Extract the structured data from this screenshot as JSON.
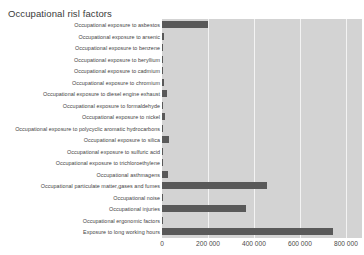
{
  "top_strip": {
    "cut_text": "———  ———— ——  ——— ———— ——— —— ——— ——— ————"
  },
  "chart_data": {
    "type": "bar",
    "orientation": "horizontal",
    "title": "Occupational risl factors",
    "xlabel": "",
    "ylabel": "",
    "xlim": [
      0,
      870000
    ],
    "grid": true,
    "legend": false,
    "bar_color": "#595959",
    "plot_background": "#d3d3d3",
    "gridline_color": "#f3f3f3",
    "xticks": [
      0,
      200000,
      400000,
      600000,
      800000
    ],
    "xtick_labels": [
      "0",
      "200 000",
      "400 000",
      "600 000",
      "800 000"
    ],
    "categories": [
      "Occupational exposure to asbestos",
      "Occupational exposure to arsenic",
      "Occupational exposure to benzene",
      "Occupational exposure to beryllium",
      "Occupational exposure to cadmium",
      "Occupational exposure to chromium",
      "Occupational exposure to diesel engine exhaust",
      "Occupational exposure to formaldehyde",
      "Occupational exposure to nickel",
      "Occupational exposure to polycyclic aromatic hydrocarbons",
      "Occupational exposure to silica",
      "Occupational exposure to sulfuric acid",
      "Occupational exposure to trichloroethylene",
      "Occupational asthmagens",
      "Occupational particulate matter,gases and fumes",
      "Occupational noise",
      "Occupational injuries",
      "Occupational ergonomic factors",
      "Exposure to long working hours"
    ],
    "values": [
      200000,
      8000,
      6000,
      4000,
      4000,
      9000,
      22000,
      4000,
      11000,
      6000,
      30000,
      4000,
      2000,
      26000,
      455000,
      1000,
      365000,
      1000,
      745000
    ]
  }
}
